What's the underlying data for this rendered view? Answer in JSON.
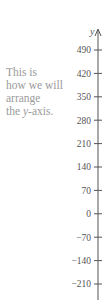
{
  "caption": {
    "lines": [
      "This is",
      "how we will",
      "arrange",
      "the "
    ],
    "italic_word": "y",
    "suffix": "-axis."
  },
  "axis": {
    "label": "y",
    "color": "#555555",
    "caption_color": "#9a9a9a"
  },
  "chart_data": {
    "type": "axis",
    "title": "",
    "ylabel": "y",
    "ticks": [
      490,
      420,
      350,
      280,
      210,
      140,
      70,
      0,
      -70,
      -140,
      -210
    ],
    "tick_labels": [
      "490",
      "420",
      "350",
      "280",
      "210",
      "140",
      "70",
      "0",
      "−70",
      "−140",
      "−210"
    ],
    "tick_step": 70,
    "ylim": [
      -250,
      540
    ],
    "annotation": "This is how we will arrange the y-axis."
  }
}
